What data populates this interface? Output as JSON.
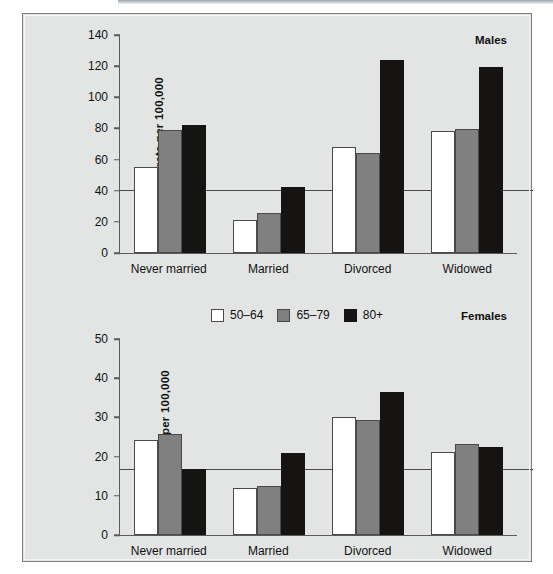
{
  "figure": {
    "background_color": "#e3e5e4",
    "border_color": "#7d7d7d"
  },
  "legend": {
    "items": [
      {
        "label": "50–64",
        "color": "#ffffff",
        "name": "legend-swatch-50-64"
      },
      {
        "label": "65–79",
        "color": "#808080",
        "name": "legend-swatch-65-79"
      },
      {
        "label": "80+",
        "color": "#161412",
        "name": "legend-swatch-80-plus"
      }
    ]
  },
  "panels": [
    {
      "id": "males",
      "title": "Males",
      "ylabel": "Suicide rate per 100,000",
      "yticks": [
        0,
        20,
        40,
        60,
        80,
        100,
        120,
        140
      ],
      "ylim": [
        0,
        140
      ],
      "reference_line": 40,
      "categories": [
        "Never married",
        "Married",
        "Divorced",
        "Widowed"
      ]
    },
    {
      "id": "females",
      "title": "Females",
      "ylabel": "Suicide rate per 100,000",
      "yticks": [
        0,
        10,
        20,
        30,
        40,
        50
      ],
      "ylim": [
        0,
        50
      ],
      "reference_line": 16.7,
      "categories": [
        "Never married",
        "Married",
        "Divorced",
        "Widowed"
      ]
    }
  ],
  "chart_data": [
    {
      "type": "bar",
      "title": "Males",
      "xlabel": "",
      "ylabel": "Suicide rate per 100,000",
      "ylim": [
        0,
        140
      ],
      "yticks": [
        0,
        20,
        40,
        60,
        80,
        100,
        120,
        140
      ],
      "grid": false,
      "reference_line": 40,
      "legend_position": "top-center (shared, shown on Females panel)",
      "categories": [
        "Never married",
        "Married",
        "Divorced",
        "Widowed"
      ],
      "series": [
        {
          "name": "50–64",
          "color": "#ffffff",
          "values": [
            55.0,
            21.5,
            68.0,
            78.5
          ]
        },
        {
          "name": "65–79",
          "color": "#808080",
          "values": [
            79.0,
            26.0,
            64.0,
            79.5
          ]
        },
        {
          "name": "80+",
          "color": "#161412",
          "values": [
            82.0,
            42.5,
            124.0,
            119.5
          ]
        }
      ]
    },
    {
      "type": "bar",
      "title": "Females",
      "xlabel": "",
      "ylabel": "Suicide rate per 100,000",
      "ylim": [
        0,
        50
      ],
      "yticks": [
        0,
        10,
        20,
        30,
        40,
        50
      ],
      "grid": false,
      "reference_line": 16.7,
      "legend_position": "top-center",
      "categories": [
        "Never married",
        "Married",
        "Divorced",
        "Widowed"
      ],
      "series": [
        {
          "name": "50–64",
          "color": "#ffffff",
          "values": [
            24.2,
            12.0,
            30.0,
            21.2
          ]
        },
        {
          "name": "65–79",
          "color": "#808080",
          "values": [
            25.7,
            12.4,
            29.3,
            23.3
          ]
        },
        {
          "name": "80+",
          "color": "#161412",
          "values": [
            16.8,
            20.8,
            36.6,
            22.5
          ]
        }
      ]
    }
  ]
}
